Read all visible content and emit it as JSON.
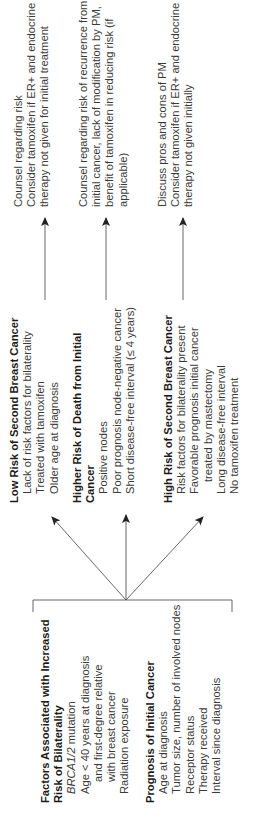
{
  "factors": {
    "bilaterality": {
      "heading_line1": "Factors Associated with Increased",
      "heading_line2": "Risk of Bilaterality",
      "brca_italic": "BRCA1/2",
      "brca_rest": " mutation",
      "age_line1": "Age < 40 years at diagnosis",
      "age_line2": "and first-degree relative",
      "age_line3": "with breast cancer",
      "radiation": "Radiation exposure"
    },
    "prognosis": {
      "heading": "Prognosis of Initial Cancer",
      "items": [
        "Age at diagnosis",
        "Tumor size, number of involved nodes",
        "Receptor status",
        "Therapy received",
        "Interval since diagnosis"
      ]
    }
  },
  "categories": {
    "low_risk": {
      "heading": "Low Risk of Second Breast Cancer",
      "items": [
        "Lack of risk factors for bilaterality",
        "Treated with tamoxifen",
        "Older age at diagnosis"
      ]
    },
    "higher_death": {
      "heading_line1": "Higher Risk of Death from Initial",
      "heading_line2": "Cancer",
      "items": [
        "Positive nodes",
        "Poor prognosis node-negative cancer",
        "Short disease-free interval (≤ 4 years)"
      ]
    },
    "high_risk": {
      "heading": "High Risk of Second Breast Cancer",
      "items": [
        "Risk factors for bilaterality present",
        "Favorable prognosis initial cancer",
        "treated by mastectomy",
        "Long disease-free interval",
        "No tamoxifen treatment"
      ]
    }
  },
  "recommendations": {
    "low_risk": [
      "Counsel regarding risk",
      "Consider tamoxifen if ER+ and endocrine",
      "therapy not given for initial treatment"
    ],
    "higher_death": [
      "Counsel regarding risk of recurrence from",
      "initial cancer, lack of modification by PM,",
      "benefit of tamoxifen in reducing risk (if",
      "applicable)"
    ],
    "high_risk": [
      "Discuss pros and cons of PM",
      "Consider tamoxifen if ER+ and endocrine",
      "therapy not given initially"
    ]
  },
  "colors": {
    "text": "#2a2a2a",
    "lines": "#555555",
    "background": "#ffffff"
  },
  "layout": {
    "orientation": "rotated 90 degrees counter-clockwise"
  }
}
